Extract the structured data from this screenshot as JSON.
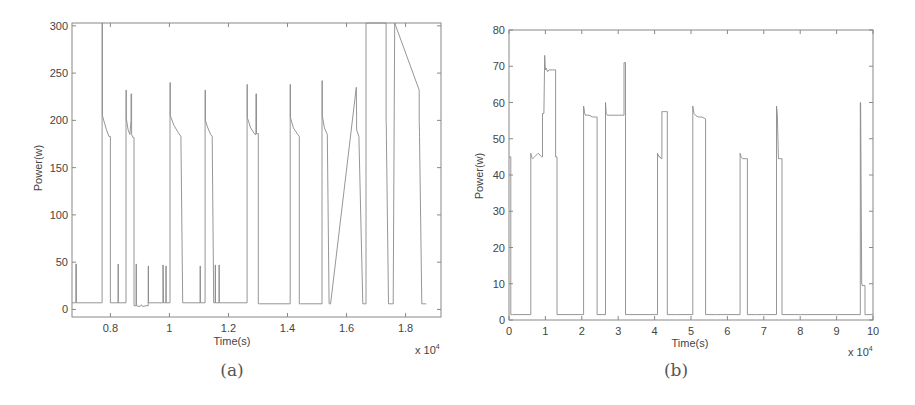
{
  "chart_data": [
    {
      "id": "a",
      "type": "line",
      "caption": "(a)",
      "title": "",
      "xlabel": "Time(s)",
      "ylabel": "Power(w)",
      "x_multiplier_label": "x 10",
      "x_multiplier_exp": "4",
      "xlim": [
        6700,
        19200
      ],
      "ylim": [
        -8,
        303
      ],
      "xticks": [
        8000,
        10000,
        12000,
        14000,
        16000,
        18000
      ],
      "xtick_labels": [
        "0.8",
        "1",
        "1.2",
        "1.4",
        "1.6",
        "1.8"
      ],
      "yticks": [
        0,
        50,
        100,
        150,
        200,
        250,
        300
      ],
      "ytick_labels": [
        "0",
        "50",
        "100",
        "150",
        "200",
        "250",
        "300"
      ],
      "grid": false,
      "legend": null,
      "color": "#8a8a8a",
      "frame_px": {
        "x0": 72,
        "y0": 23,
        "x1": 441,
        "y1": 317
      },
      "series": [
        {
          "name": "power",
          "x": [
            6700,
            6830,
            6830,
            6850,
            6850,
            7720,
            7720,
            7730,
            7730,
            7800,
            7870,
            7950,
            7950,
            8000,
            8000,
            8260,
            8260,
            8270,
            8270,
            8530,
            8530,
            8540,
            8540,
            8600,
            8660,
            8700,
            8700,
            8720,
            8720,
            8760,
            8790,
            8800,
            8800,
            8870,
            8870,
            8880,
            8880,
            9000,
            9050,
            9100,
            9200,
            9280,
            9280,
            9290,
            9290,
            9780,
            9780,
            9790,
            9800,
            9880,
            9880,
            9890,
            9890,
            10020,
            10020,
            10030,
            10030,
            10150,
            10300,
            10390,
            10390,
            10450,
            10450,
            11040,
            11040,
            11050,
            11050,
            11210,
            11210,
            11220,
            11220,
            11300,
            11400,
            11450,
            11450,
            11500,
            11500,
            11550,
            11550,
            11560,
            11560,
            11680,
            11680,
            11690,
            11690,
            12630,
            12630,
            12640,
            12640,
            12750,
            12900,
            12930,
            12930,
            12950,
            12950,
            13010,
            13010,
            13060,
            13060,
            14090,
            14090,
            14100,
            14100,
            14200,
            14350,
            14400,
            14400,
            14450,
            14450,
            15170,
            15170,
            15180,
            15180,
            15250,
            15350,
            15410,
            15410,
            15460,
            15460,
            16330,
            16330,
            16340,
            16340,
            16420,
            16550,
            16600,
            16600,
            16660,
            16660,
            17340,
            17340,
            17350,
            17350,
            17420,
            17520,
            17580,
            17580,
            17630,
            17630,
            18460,
            18460,
            18470,
            18470,
            18550,
            18650,
            18700,
            18700,
            18750,
            18750,
            19200
          ],
          "y": [
            7,
            7,
            48,
            48,
            7,
            7,
            305,
            305,
            205,
            197,
            190,
            183,
            183,
            183,
            7,
            7,
            48,
            48,
            7,
            7,
            232,
            232,
            202,
            190,
            185,
            200,
            228,
            228,
            185,
            182,
            182,
            182,
            4,
            4,
            48,
            48,
            4,
            3,
            5,
            3,
            4,
            4,
            46,
            46,
            7,
            7,
            47,
            47,
            7,
            7,
            46,
            46,
            7,
            7,
            240,
            240,
            205,
            195,
            187,
            183,
            183,
            7,
            7,
            7,
            46,
            46,
            7,
            7,
            232,
            232,
            200,
            192,
            185,
            183,
            183,
            7,
            7,
            7,
            47,
            47,
            7,
            7,
            47,
            47,
            7,
            7,
            238,
            238,
            203,
            192,
            185,
            185,
            228,
            228,
            186,
            186,
            6,
            6,
            6,
            6,
            238,
            238,
            203,
            192,
            185,
            183,
            6,
            6,
            6,
            6,
            242,
            242,
            205,
            192,
            185,
            6,
            6,
            6,
            6,
            235,
            235,
            203,
            190,
            183,
            6,
            6,
            6,
            6,
            305,
            305,
            200,
            190,
            183,
            6,
            6,
            6,
            6,
            305,
            305,
            232,
            200,
            187,
            183,
            6,
            6,
            6
          ]
        }
      ]
    },
    {
      "id": "b",
      "type": "line",
      "caption": "(b)",
      "title": "",
      "xlabel": "Time(s)",
      "ylabel": "Power(w)",
      "x_multiplier_label": "x 10",
      "x_multiplier_exp": "4",
      "xlim": [
        0,
        100000
      ],
      "ylim": [
        0,
        80
      ],
      "xticks": [
        0,
        10000,
        20000,
        30000,
        40000,
        50000,
        60000,
        70000,
        80000,
        90000,
        100000
      ],
      "xtick_labels": [
        "0",
        "1",
        "2",
        "3",
        "4",
        "5",
        "6",
        "7",
        "8",
        "9",
        "10"
      ],
      "yticks": [
        0,
        10,
        20,
        30,
        40,
        50,
        60,
        70,
        80
      ],
      "ytick_labels": [
        "0",
        "10",
        "20",
        "30",
        "40",
        "50",
        "60",
        "70",
        "80"
      ],
      "grid": false,
      "legend": null,
      "color": "#8a8a8a",
      "frame_px": {
        "x0": 509,
        "y0": 30,
        "x1": 873,
        "y1": 320
      },
      "series": [
        {
          "name": "power",
          "x": [
            0,
            0,
            500,
            500,
            1000,
            3000,
            6000,
            6000,
            6200,
            6500,
            7000,
            8000,
            9000,
            9200,
            9200,
            9600,
            9800,
            9800,
            10000,
            10200,
            10600,
            11000,
            12000,
            12800,
            12800,
            13200,
            13200,
            14000,
            17000,
            20500,
            20500,
            20800,
            21000,
            22000,
            23000,
            24000,
            24200,
            24200,
            25000,
            26500,
            26500,
            26700,
            27000,
            28000,
            30000,
            31000,
            31500,
            31600,
            31600,
            32000,
            32000,
            33000,
            36000,
            40800,
            40800,
            41200,
            41500,
            41800,
            42000,
            42000,
            42500,
            43000,
            43500,
            43500,
            46000,
            50500,
            50500,
            50800,
            51200,
            52000,
            53000,
            54000,
            54000,
            57000,
            63500,
            63500,
            63800,
            64200,
            65000,
            65500,
            65500,
            68000,
            73500,
            73500,
            73700,
            74000,
            74500,
            75000,
            75000,
            80000,
            90000,
            96500,
            96500,
            96600,
            96900,
            97000,
            97000,
            97500,
            97800,
            97800,
            100000
          ],
          "y": [
            45,
            45,
            45,
            1.5,
            1.5,
            1.5,
            1.5,
            46,
            45,
            44.5,
            45,
            46,
            45,
            45,
            57,
            57,
            73,
            73,
            69,
            69.5,
            68.5,
            69,
            69,
            69,
            45,
            45,
            1.5,
            1.5,
            1.5,
            1.5,
            59,
            57,
            56.5,
            56.5,
            56,
            56,
            56,
            1.5,
            1.5,
            1.5,
            60,
            57,
            56.5,
            56.5,
            56.5,
            56.5,
            56.5,
            56.5,
            71,
            71,
            1.5,
            1.5,
            1.5,
            1.5,
            46,
            45,
            45,
            44.5,
            44.5,
            57.5,
            57.5,
            57.5,
            57.5,
            1.5,
            1.5,
            1.5,
            59,
            57,
            56.5,
            56,
            56,
            55.5,
            1.5,
            1.5,
            1.5,
            46,
            45,
            44.5,
            44.5,
            44.5,
            1.5,
            1.5,
            1.5,
            59,
            57,
            44.5,
            44.5,
            44.5,
            1.5,
            1.5,
            1.5,
            1.5,
            60,
            60,
            10,
            10,
            9.5,
            9.5,
            9.5,
            1.5,
            1.5
          ]
        }
      ]
    }
  ]
}
